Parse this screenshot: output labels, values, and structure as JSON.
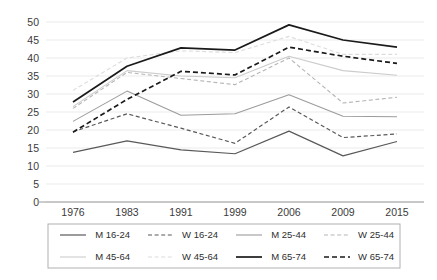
{
  "chart_data": {
    "type": "line",
    "title": "",
    "subtitle": "",
    "xlabel": "",
    "ylabel": "",
    "categories": [
      "1976",
      "1983",
      "1991",
      "1999",
      "2006",
      "2009",
      "2015"
    ],
    "ylim": [
      0,
      50
    ],
    "yticks": [
      0,
      5,
      10,
      15,
      20,
      25,
      30,
      35,
      40,
      45,
      50
    ],
    "ytick_labels": [
      "0",
      "5",
      "10",
      "15",
      "20",
      "25",
      "30",
      "35",
      "40",
      "45",
      "50"
    ],
    "grid": true,
    "grid_axis": "y",
    "legend_position": "bottom",
    "legend_columns": 4,
    "series": [
      {
        "name": "M 16-24",
        "values": [
          13.8,
          17.0,
          14.5,
          13.4,
          19.7,
          12.8,
          16.8
        ],
        "color": "#595959",
        "style": "solid",
        "width": 1.2
      },
      {
        "name": "W 16-24",
        "values": [
          19.5,
          24.5,
          20.5,
          16.3,
          26.4,
          17.9,
          18.9
        ],
        "color": "#595959",
        "style": "dashed",
        "width": 1.2
      },
      {
        "name": "M 25-44",
        "values": [
          22.4,
          30.8,
          24.1,
          24.5,
          29.8,
          23.8,
          23.7
        ],
        "color": "#9c9c9c",
        "style": "solid",
        "width": 1.1
      },
      {
        "name": "W 25-44",
        "values": [
          26.0,
          36.0,
          34.3,
          32.6,
          40.0,
          27.5,
          29.1
        ],
        "color": "#b5b5b5",
        "style": "dashed",
        "width": 1.1
      },
      {
        "name": "M 45-64",
        "values": [
          26.5,
          36.5,
          35.0,
          34.5,
          40.5,
          36.5,
          35.2
        ],
        "color": "#cccccc",
        "style": "solid",
        "width": 1.1
      },
      {
        "name": "W 45-64",
        "values": [
          31.0,
          40.0,
          42.0,
          41.5,
          46.0,
          41.0,
          41.0
        ],
        "color": "#dcdcdc",
        "style": "dashed",
        "width": 1.1
      },
      {
        "name": "M 65-74",
        "values": [
          27.8,
          37.7,
          42.8,
          42.2,
          49.2,
          45.0,
          43.0
        ],
        "color": "#1a1a1a",
        "style": "solid",
        "width": 1.7
      },
      {
        "name": "W 65-74",
        "values": [
          19.4,
          28.5,
          36.3,
          35.3,
          43.0,
          40.5,
          38.5
        ],
        "color": "#1a1a1a",
        "style": "dashed",
        "width": 1.7
      }
    ]
  },
  "legend": {
    "entries": [
      "M 16-24",
      "W 16-24",
      "M 25-44",
      "W 25-44",
      "M 45-64",
      "W 45-64",
      "M 65-74",
      "W 65-74"
    ]
  }
}
